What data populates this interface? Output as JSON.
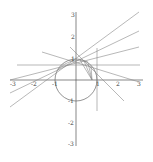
{
  "figure": {
    "x_ticks": [
      "-3",
      "-2",
      "-1",
      "1",
      "2",
      "3"
    ],
    "y_ticks": [
      "3",
      "2",
      "1",
      "-1",
      "-2",
      "-3"
    ],
    "line_color": "#888888",
    "axis_color": "#555555"
  },
  "labels": {
    "x_m3": "-3",
    "x_m2": "-2",
    "x_m1": "-1",
    "x_1": "1",
    "x_2": "2",
    "x_3": "3",
    "y_3": "3",
    "y_2": "2",
    "y_1": "1",
    "y_m1": "-1",
    "y_m2": "-2",
    "y_m3": "-3"
  }
}
